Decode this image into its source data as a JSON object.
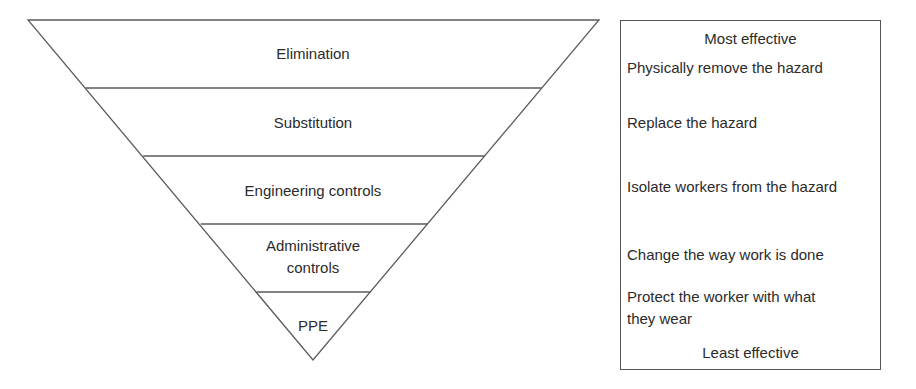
{
  "diagram": {
    "levels": [
      {
        "label": "Elimination",
        "description": "Physically remove the hazard"
      },
      {
        "label": "Substitution",
        "description": "Replace the hazard"
      },
      {
        "label": "Engineering controls",
        "description": "Isolate workers from the hazard"
      },
      {
        "label_line1": "Administrative",
        "label_line2": "controls",
        "description": "Change the way work is done"
      },
      {
        "label": "PPE",
        "description_line1": "Protect the worker with what",
        "description_line2": "they wear"
      }
    ],
    "effectiveness": {
      "top": "Most effective",
      "bottom": "Least effective"
    },
    "colors": {
      "line": "#5a5a5a",
      "text": "#2b2b2b",
      "background": "#ffffff"
    }
  }
}
